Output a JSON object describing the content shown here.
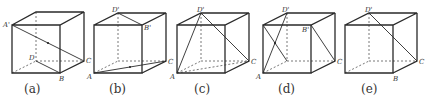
{
  "figure": {
    "panels": [
      {
        "caption": "(a)",
        "labels": {
          "A1": "A'",
          "D": "D",
          "B": "B",
          "C": "C"
        }
      },
      {
        "caption": "(b)",
        "labels": {
          "D1": "D'",
          "B1": "B'",
          "A": "A",
          "C": "C"
        }
      },
      {
        "caption": "(c)",
        "labels": {
          "D1": "D'",
          "A": "A",
          "C": "C"
        }
      },
      {
        "caption": "(d)",
        "labels": {
          "D1": "D'",
          "B1": "B'",
          "A": "A",
          "C": "C"
        }
      },
      {
        "caption": "(e)",
        "labels": {
          "D1": "D'",
          "B": "B",
          "C": "C"
        }
      }
    ]
  }
}
